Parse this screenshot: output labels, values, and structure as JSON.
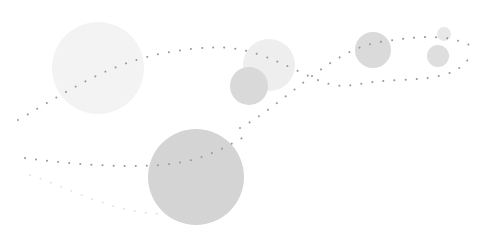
{
  "illustration": {
    "background": "#ffffff",
    "dot_color": "#9a9a9a",
    "faint_dot_color": "#e4e4e4",
    "circles": [
      {
        "name": "large-pale-circle",
        "cx": 98,
        "cy": 68,
        "r": 46,
        "fill": "#f3f3f3"
      },
      {
        "name": "pale-circle-center",
        "cx": 269,
        "cy": 65,
        "r": 26,
        "fill": "#eeeeee"
      },
      {
        "name": "mid-circle-center",
        "cx": 249,
        "cy": 86,
        "r": 19,
        "fill": "#d9d9d9"
      },
      {
        "name": "mid-circle-right",
        "cx": 373,
        "cy": 50,
        "r": 18,
        "fill": "#dadada"
      },
      {
        "name": "small-circle-top-right",
        "cx": 444,
        "cy": 34,
        "r": 7,
        "fill": "#e8e8e8"
      },
      {
        "name": "small-circle-right",
        "cx": 438,
        "cy": 56,
        "r": 11,
        "fill": "#dedede"
      },
      {
        "name": "large-dark-circle",
        "cx": 196,
        "cy": 177,
        "r": 48,
        "fill": "#d4d4d4"
      }
    ],
    "dotted_paths": [
      {
        "name": "dotted-curve-upper",
        "d": "M18,120 C70,90 110,62 170,52 S250,48 300,72 S340,82 400,80 S460,66 470,58",
        "faint": false
      },
      {
        "name": "dotted-curve-middle",
        "d": "M240,128 C290,100 330,50 380,42 S450,36 472,46",
        "faint": false
      },
      {
        "name": "dotted-curve-lower",
        "d": "M25,158 C70,164 120,168 160,165 S220,150 246,136",
        "faint": false
      },
      {
        "name": "dotted-curve-faint",
        "d": "M30,175 C70,188 110,212 160,214",
        "faint": true
      }
    ]
  }
}
